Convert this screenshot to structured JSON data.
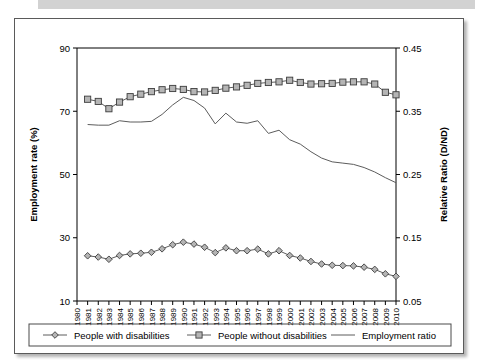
{
  "figure": {
    "left_axis_title": "Employment rate (%)",
    "right_axis_title": "Relative Ratio (D/ND)",
    "legend": [
      {
        "label": "People with disabilities",
        "marker": "diamond-marker"
      },
      {
        "label": "People without disabilities",
        "marker": "square-marker"
      },
      {
        "label": "Employment ratio",
        "marker": "plain-line"
      }
    ]
  },
  "chart_data": {
    "type": "line",
    "title": "",
    "xlabel": "",
    "ylabel": "Employment rate (%)",
    "y2label": "Relative Ratio (D/ND)",
    "ylim": [
      10,
      90
    ],
    "y2lim": [
      0.05,
      0.45
    ],
    "yticks": [
      10,
      30,
      50,
      70,
      90
    ],
    "y2ticks": [
      0.05,
      0.15,
      0.25,
      0.35,
      0.45
    ],
    "grid": false,
    "legend_position": "bottom",
    "categories": [
      "1980",
      "1981",
      "1982",
      "1983",
      "1984",
      "1985",
      "1986",
      "1987",
      "1988",
      "1989",
      "1990",
      "1991",
      "1992",
      "1993",
      "1994",
      "1995",
      "1996",
      "1997",
      "1998",
      "1999",
      "2000",
      "2001",
      "2002",
      "2003",
      "2004",
      "2005",
      "2006",
      "2007",
      "2008",
      "2009",
      "2010"
    ],
    "series": [
      {
        "name": "People with disabilities",
        "axis": "left",
        "marker": "diamond",
        "values": [
          null,
          24.3,
          23.9,
          23.2,
          24.4,
          24.9,
          25.1,
          25.4,
          26.5,
          27.8,
          28.6,
          28.0,
          27.0,
          25.3,
          26.8,
          25.9,
          25.9,
          26.4,
          24.9,
          25.9,
          24.4,
          23.6,
          22.5,
          21.7,
          21.3,
          21.2,
          21.1,
          20.7,
          20.0,
          18.6,
          17.8
        ]
      },
      {
        "name": "People without disabilities",
        "axis": "left",
        "marker": "square",
        "values": [
          null,
          73.8,
          73.1,
          70.8,
          72.9,
          74.6,
          75.4,
          76.2,
          76.8,
          77.2,
          76.9,
          76.2,
          76.1,
          76.6,
          77.3,
          77.7,
          78.2,
          78.8,
          79.1,
          79.3,
          79.8,
          79.1,
          78.6,
          78.7,
          78.8,
          79.2,
          79.3,
          79.3,
          78.6,
          76.0,
          75.2
        ]
      },
      {
        "name": "Employment ratio",
        "axis": "right",
        "marker": "none",
        "values": [
          null,
          0.329,
          0.328,
          0.328,
          0.335,
          0.333,
          0.333,
          0.334,
          0.345,
          0.36,
          0.372,
          0.367,
          0.355,
          0.33,
          0.347,
          0.333,
          0.331,
          0.335,
          0.315,
          0.32,
          0.305,
          0.298,
          0.286,
          0.276,
          0.27,
          0.268,
          0.266,
          0.261,
          0.254,
          0.245,
          0.237
        ]
      }
    ]
  }
}
